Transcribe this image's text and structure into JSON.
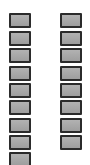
{
  "canvas": {
    "width": 90,
    "height": 165,
    "background_color": "#ffffff"
  },
  "style": {
    "cell_border_color": "#2b2b2b",
    "cell_fill_color": "#a8a8a8",
    "cell_width": 22,
    "cell_height": 15,
    "cell_border_width": 2,
    "vertical_pitch": 17.5
  },
  "columns": [
    {
      "id": "column-left",
      "name": "left-column",
      "x": 9,
      "count": 9,
      "cells": [
        {
          "label": "",
          "y": 13,
          "clipped": false
        },
        {
          "label": "",
          "y": 31,
          "clipped": false
        },
        {
          "label": "",
          "y": 48,
          "clipped": false
        },
        {
          "label": "",
          "y": 66,
          "clipped": false
        },
        {
          "label": "",
          "y": 83,
          "clipped": false
        },
        {
          "label": "",
          "y": 100,
          "clipped": false
        },
        {
          "label": "",
          "y": 118,
          "clipped": false
        },
        {
          "label": "",
          "y": 135,
          "clipped": false
        },
        {
          "label": "",
          "y": 152,
          "clipped": true
        }
      ]
    },
    {
      "id": "column-right",
      "name": "right-column",
      "x": 60,
      "count": 8,
      "cells": [
        {
          "label": "",
          "y": 13,
          "clipped": false
        },
        {
          "label": "",
          "y": 31,
          "clipped": false
        },
        {
          "label": "",
          "y": 48,
          "clipped": false
        },
        {
          "label": "",
          "y": 66,
          "clipped": false
        },
        {
          "label": "",
          "y": 83,
          "clipped": false
        },
        {
          "label": "",
          "y": 100,
          "clipped": false
        },
        {
          "label": "",
          "y": 118,
          "clipped": false
        },
        {
          "label": "",
          "y": 135,
          "clipped": false
        }
      ]
    }
  ]
}
